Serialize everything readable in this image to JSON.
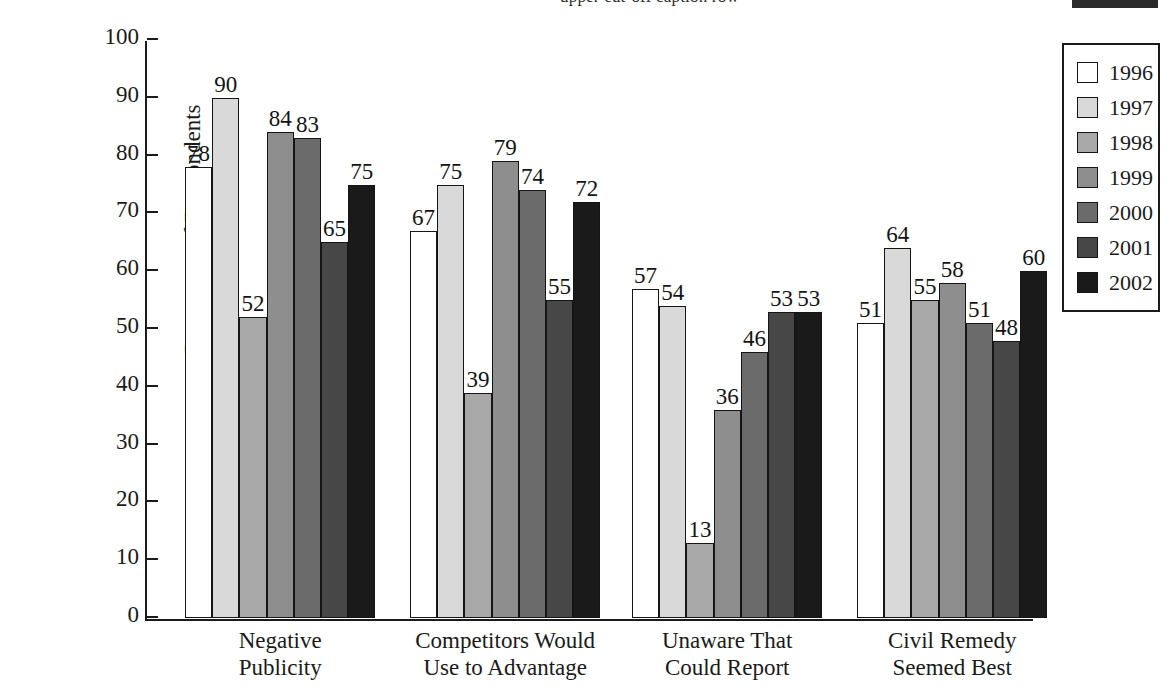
{
  "top_sliver": {
    "text": "upper cut-off caption row",
    "visible": true
  },
  "chart_data": {
    "type": "bar",
    "title": "",
    "subtitle": "",
    "xlabel": "",
    "ylabel": "Percentage of Respondents",
    "ylim": [
      0,
      100
    ],
    "ytick_step": 10,
    "yticks": [
      0,
      10,
      20,
      30,
      40,
      50,
      60,
      70,
      80,
      90,
      100
    ],
    "ytick_labels": [
      "0",
      "10",
      "20",
      "30",
      "40",
      "50",
      "60",
      "70",
      "80",
      "90",
      "100"
    ],
    "grid": false,
    "legend_position": "right",
    "data_labels": true,
    "categories": [
      "Negative\nPublicity",
      "Competitors Would\nUse to Advantage",
      "Unaware That\nCould Report",
      "Civil Remedy\nSeemed Best"
    ],
    "category_lines": [
      [
        "Negative",
        "Publicity"
      ],
      [
        "Competitors Would",
        "Use to Advantage"
      ],
      [
        "Unaware That",
        "Could Report"
      ],
      [
        "Civil Remedy",
        "Seemed Best"
      ]
    ],
    "series": [
      {
        "name": "1996",
        "color": "#ffffff",
        "values": [
          78,
          67,
          57,
          51
        ]
      },
      {
        "name": "1997",
        "color": "#d9d9d9",
        "values": [
          90,
          75,
          54,
          64
        ]
      },
      {
        "name": "1998",
        "color": "#a8a8a8",
        "values": [
          52,
          39,
          13,
          55
        ]
      },
      {
        "name": "1999",
        "color": "#8e8e8e",
        "values": [
          84,
          79,
          36,
          58
        ]
      },
      {
        "name": "2000",
        "color": "#6b6b6b",
        "values": [
          83,
          74,
          46,
          51
        ]
      },
      {
        "name": "2001",
        "color": "#474747",
        "values": [
          65,
          55,
          53,
          48
        ]
      },
      {
        "name": "2002",
        "color": "#1a1a1a",
        "values": [
          75,
          72,
          53,
          60
        ]
      }
    ]
  },
  "legend": {
    "title": "",
    "entries": [
      {
        "label": "1996",
        "color": "#ffffff"
      },
      {
        "label": "1997",
        "color": "#d9d9d9"
      },
      {
        "label": "1998",
        "color": "#a8a8a8"
      },
      {
        "label": "1999",
        "color": "#8e8e8e"
      },
      {
        "label": "2000",
        "color": "#6b6b6b"
      },
      {
        "label": "2001",
        "color": "#474747"
      },
      {
        "label": "2002",
        "color": "#1a1a1a"
      }
    ]
  }
}
